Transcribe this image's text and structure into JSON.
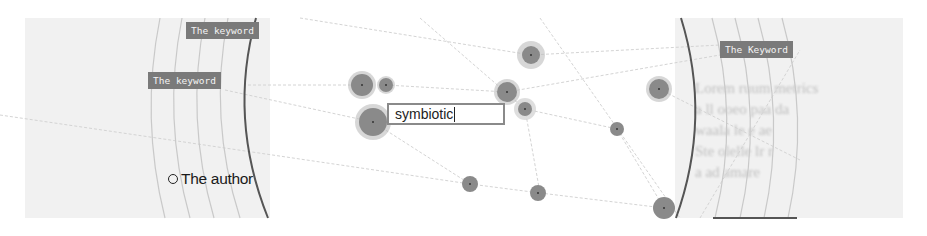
{
  "search": {
    "value": "symbiotic"
  },
  "keywords": [
    {
      "id": "kw-top-left",
      "label": "The keyword",
      "x": 186,
      "y": 22
    },
    {
      "id": "kw-mid-left",
      "label": "The keyword",
      "x": 148,
      "y": 72
    },
    {
      "id": "kw-right",
      "label": "The Keyword",
      "x": 720,
      "y": 41
    }
  ],
  "author": {
    "label": "The author"
  },
  "background_text": {
    "right_lines": [
      "Lorem ruum metrics",
      "a ll ooeo paa da",
      "waala le e ae",
      "Ste olelle lr r",
      "a ad amare"
    ],
    "left_lines": [
      "",
      "",
      "",
      ""
    ]
  },
  "colors": {
    "node": "#8a8a8a",
    "node_halo": "#bdbdbd",
    "arc": "#555555",
    "guide_arc": "#c8c8c8",
    "edge": "#d6d6d6",
    "label_bg": "#7a7a7a"
  },
  "nodes": [
    {
      "cx": 362,
      "cy": 85,
      "r": 11,
      "halo": 14
    },
    {
      "cx": 386,
      "cy": 85,
      "r": 7,
      "halo": 9
    },
    {
      "cx": 373,
      "cy": 122,
      "r": 14,
      "halo": 18
    },
    {
      "cx": 531,
      "cy": 55,
      "r": 9,
      "halo": 14
    },
    {
      "cx": 507,
      "cy": 92,
      "r": 10,
      "halo": 13
    },
    {
      "cx": 525,
      "cy": 109,
      "r": 7,
      "halo": 11
    },
    {
      "cx": 617,
      "cy": 129,
      "r": 7,
      "halo": 8
    },
    {
      "cx": 659,
      "cy": 89,
      "r": 10,
      "halo": 13
    },
    {
      "cx": 470,
      "cy": 184,
      "r": 8,
      "halo": 9
    },
    {
      "cx": 538,
      "cy": 193,
      "r": 8,
      "halo": 9
    },
    {
      "cx": 664,
      "cy": 208,
      "r": 10,
      "halo": 11
    }
  ]
}
